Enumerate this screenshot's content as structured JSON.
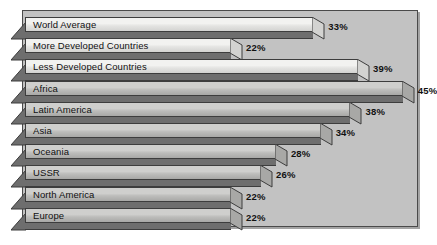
{
  "chart_data": {
    "type": "bar",
    "orientation": "horizontal",
    "title": "",
    "subtitle": "",
    "xlabel": "",
    "ylabel": "",
    "grid": false,
    "legend": false,
    "value_suffix": "%",
    "xlim": [
      0,
      50
    ],
    "categories": [
      "World Average",
      "More Developed Countries",
      "Less Developed Countries",
      "Africa",
      "Latin America",
      "Asia",
      "Oceania",
      "USSR",
      "North America",
      "Europe"
    ],
    "values": [
      33,
      22,
      39,
      45,
      38,
      34,
      28,
      26,
      22,
      22
    ],
    "value_labels": [
      "33%",
      "22%",
      "39%",
      "45%",
      "38%",
      "34%",
      "28%",
      "26%",
      "22%",
      "22%"
    ],
    "bars": [
      {
        "label": "World Average",
        "value": 33,
        "value_label": "33%",
        "tone": "light"
      },
      {
        "label": "More Developed Countries",
        "value": 22,
        "value_label": "22%",
        "tone": "light"
      },
      {
        "label": "Less Developed Countries",
        "value": 39,
        "value_label": "39%",
        "tone": "light"
      },
      {
        "label": "Africa",
        "value": 45,
        "value_label": "45%",
        "tone": "gray"
      },
      {
        "label": "Latin America",
        "value": 38,
        "value_label": "38%",
        "tone": "gray"
      },
      {
        "label": "Asia",
        "value": 34,
        "value_label": "34%",
        "tone": "gray"
      },
      {
        "label": "Oceania",
        "value": 28,
        "value_label": "28%",
        "tone": "gray"
      },
      {
        "label": "USSR",
        "value": 26,
        "value_label": "26%",
        "tone": "gray"
      },
      {
        "label": "North America",
        "value": 22,
        "value_label": "22%",
        "tone": "gray"
      },
      {
        "label": "Europe",
        "value": 22,
        "value_label": "22%",
        "tone": "gray"
      }
    ]
  },
  "colors": {
    "plot_background": "#c2c2c2",
    "frame_border": "#4a4a4a",
    "bar_light_high": "#f2f2f0",
    "bar_light_low": "#d3d3d1",
    "bar_gray_high": "#cfcfcd",
    "bar_gray_low": "#a8a8a6",
    "bar_outline": "#3d3d3d",
    "bar_shadow": "#6e6e6e",
    "text": "#111111",
    "page_background": "#ffffff"
  }
}
